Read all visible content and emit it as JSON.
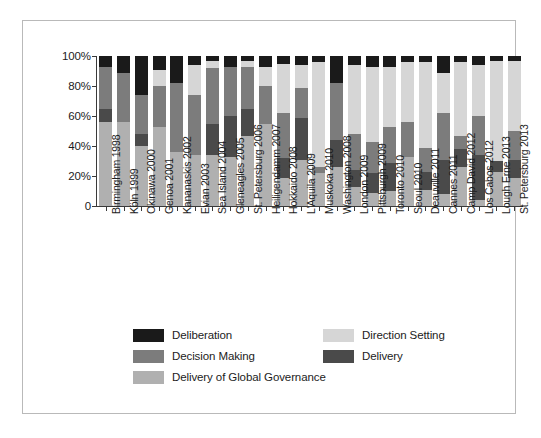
{
  "chart_data": {
    "type": "bar",
    "subtype": "stacked-percent",
    "title": "",
    "xlabel": "",
    "ylabel": "",
    "ylim": [
      0,
      100
    ],
    "yticks": [
      "0",
      "20%",
      "40%",
      "60%",
      "80%",
      "100%"
    ],
    "ytick_values": [
      0,
      20,
      40,
      60,
      80,
      100
    ],
    "grid": false,
    "legend_position": "bottom",
    "stack_order_bottom_to_top": [
      "Delivery of Global Governance",
      "Delivery",
      "Decision Making",
      "Direction Setting",
      "Deliberation"
    ],
    "categories": [
      "Birmingham 1998",
      "Köln 1999",
      "Okinawa 2000",
      "Genoa 2001",
      "Kananaskis 2002",
      "Evian 2003",
      "Sea Island 2004",
      "Gleneagles 2005",
      "St. Petersburg 2006",
      "Heiligendamm 2007",
      "Hokkaido 2008",
      "L'Aquila 2009",
      "Muskoka 2010",
      "Washington 2008",
      "London 2009",
      "Pittsburgh 2009",
      "Toronto 2010",
      "Seoul 2010",
      "Deauville 2011",
      "Cannes 2011",
      "Camp David 2012",
      "Los Cabos 2012",
      "Lough Erne 2013",
      "St. Petersburg 2013"
    ],
    "series": [
      {
        "name": "Delivery of Global Governance",
        "color": "#b0b0b0",
        "values": [
          56,
          56,
          40,
          53,
          36,
          34,
          34,
          33,
          47,
          55,
          19,
          31,
          22,
          26,
          13,
          9,
          10,
          33,
          11,
          8,
          26,
          4,
          23,
          19
        ]
      },
      {
        "name": "Delivery",
        "color": "#4a4a4a",
        "values": [
          9,
          0,
          8,
          0,
          0,
          0,
          21,
          27,
          18,
          0,
          13,
          28,
          0,
          18,
          11,
          13,
          19,
          0,
          12,
          23,
          12,
          30,
          7,
          12
        ]
      },
      {
        "name": "Decision Making",
        "color": "#7c7c7c",
        "values": [
          28,
          33,
          26,
          27,
          46,
          40,
          37,
          33,
          28,
          25,
          30,
          20,
          4,
          38,
          24,
          21,
          24,
          23,
          16,
          31,
          9,
          26,
          0,
          19
        ]
      },
      {
        "name": "Direction Setting",
        "color": "#d6d6d6",
        "values": [
          0,
          0,
          0,
          11,
          0,
          20,
          5,
          0,
          4,
          13,
          33,
          15,
          70,
          0,
          46,
          50,
          40,
          40,
          57,
          27,
          49,
          34,
          67,
          47
        ]
      },
      {
        "name": "Deliberation",
        "color": "#1a1a1a",
        "values": [
          7,
          11,
          26,
          9,
          18,
          6,
          3,
          7,
          3,
          7,
          5,
          6,
          4,
          18,
          6,
          7,
          7,
          4,
          4,
          11,
          4,
          6,
          3,
          3
        ]
      }
    ],
    "legend": [
      {
        "label": "Deliberation",
        "color": "#1a1a1a"
      },
      {
        "label": "Direction Setting",
        "color": "#d6d6d6"
      },
      {
        "label": "Decision Making",
        "color": "#7c7c7c"
      },
      {
        "label": "Delivery",
        "color": "#4a4a4a"
      },
      {
        "label": "Delivery of Global Governance",
        "color": "#b0b0b0"
      }
    ]
  }
}
